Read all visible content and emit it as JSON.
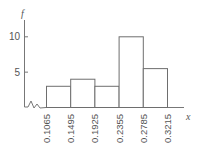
{
  "chart_data": {
    "type": "bar",
    "subtype": "histogram",
    "title": "",
    "xlabel": "x",
    "ylabel": "f",
    "bin_edges": [
      0.1065,
      0.1495,
      0.1925,
      0.2355,
      0.2785,
      0.3215
    ],
    "categories": [
      "0.1065–0.1495",
      "0.1495–0.1925",
      "0.1925–0.2355",
      "0.2355–0.2785",
      "0.2785–0.3215"
    ],
    "values": [
      3,
      4,
      3,
      10,
      5.5
    ],
    "x_tick_labels": [
      "0.1065",
      "0.1495",
      "0.1925",
      "0.2355",
      "0.2785",
      "0.3215"
    ],
    "y_ticks": [
      5,
      10
    ],
    "y_tick_labels": [
      "5",
      "10"
    ],
    "ylim": [
      0,
      11
    ],
    "grid": false,
    "legend": null,
    "axis_break": "x-axis broken (zig-zag) between origin and first bin"
  },
  "colors": {
    "axis": "#777777",
    "bar_edge": "#6e6e6e",
    "bar_fill": "#ffffff",
    "text": "#555555"
  }
}
